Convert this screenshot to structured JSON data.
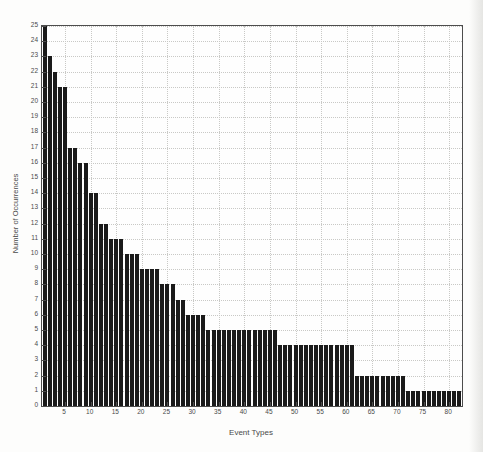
{
  "page": {
    "background": "#fdfdfc"
  },
  "chart_data": {
    "type": "bar",
    "title": "",
    "xlabel": "Event Types",
    "ylabel": "Number of Occurrences",
    "n_bars": 82,
    "x_start": 1,
    "xlim": [
      0,
      83
    ],
    "ylim": [
      0,
      25
    ],
    "y_tick_min": 0,
    "y_tick_max": 25,
    "y_tick_step": 1,
    "x_tick_labels": [
      5,
      10,
      15,
      20,
      25,
      30,
      35,
      40,
      45,
      50,
      55,
      60,
      65,
      70,
      75,
      80
    ],
    "grid": "dotted; horizontal line at every integer y, vertical line at every x tick",
    "legend": "none",
    "bar_color": "#1a1a1a",
    "values": [
      25,
      23,
      22,
      21,
      21,
      17,
      17,
      16,
      16,
      14,
      14,
      12,
      12,
      11,
      11,
      11,
      10,
      10,
      10,
      9,
      9,
      9,
      9,
      8,
      8,
      8,
      7,
      7,
      6,
      6,
      6,
      6,
      5,
      5,
      5,
      5,
      5,
      5,
      5,
      5,
      5,
      5,
      5,
      5,
      5,
      5,
      4,
      4,
      4,
      4,
      4,
      4,
      4,
      4,
      4,
      4,
      4,
      4,
      4,
      4,
      4,
      2,
      2,
      2,
      2,
      2,
      2,
      2,
      2,
      2,
      2,
      1,
      1,
      1,
      1,
      1,
      1,
      1,
      1,
      1,
      1,
      1
    ]
  },
  "colors": {
    "plot_background": "#fefefe",
    "axis_border": "#4d4d4d",
    "grid_line": "#c9c9c6",
    "tick_text": "#4a4a4a",
    "bar": "#1a1a1a"
  }
}
